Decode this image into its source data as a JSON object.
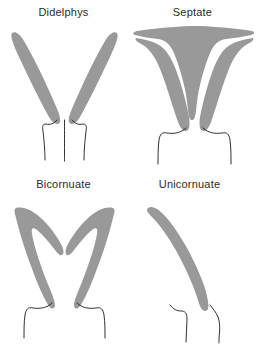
{
  "figure": {
    "width": 259,
    "height": 344,
    "background_color": "#ffffff",
    "organ_fill_color": "#999999",
    "outline_stroke_color": "#1a1a1a",
    "label_color": "#2b2b2b"
  },
  "panels": [
    {
      "id": "didelphys",
      "label": "Didelphys",
      "description": "Two completely separate narrow uterine horns, each with its own cervix, and a divided vagina shown by three thin vertical outlines.",
      "horn_count": 2,
      "cervix_count": 2,
      "septum": false
    },
    {
      "id": "septate",
      "label": "Septate",
      "description": "Single broad flat-topped uterine fundus with a central downward septum wedge dividing the cavity; single cervix and vagina.",
      "horn_count": 1,
      "cervix_count": 1,
      "septum": true
    },
    {
      "id": "bicornuate",
      "label": "Bicornuate",
      "description": "Two uterine horns joined at a V-shaped notch in the fundus, converging to a single cervix and vagina.",
      "horn_count": 2,
      "cervix_count": 1,
      "septum": false
    },
    {
      "id": "unicornuate",
      "label": "Unicornuate",
      "description": "Single banana-shaped uterine horn curving from the upper left down to one cervix and vagina.",
      "horn_count": 1,
      "cervix_count": 1,
      "septum": false
    }
  ]
}
